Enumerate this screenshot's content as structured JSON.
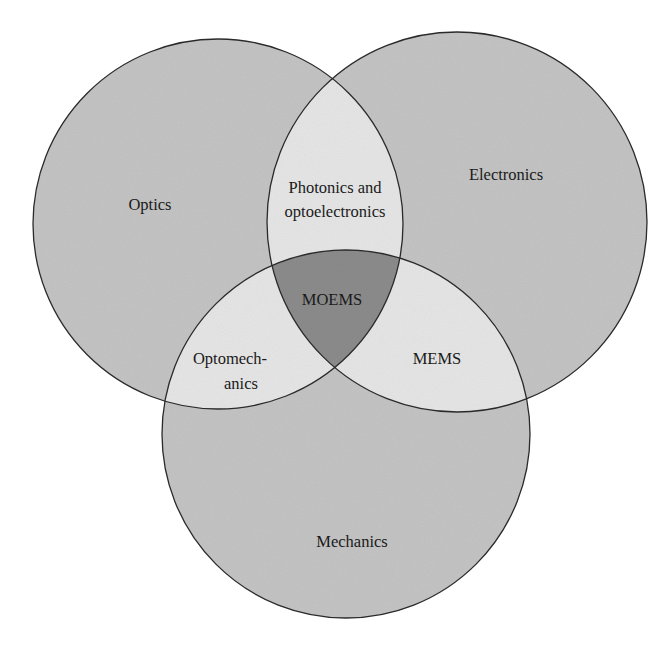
{
  "diagram": {
    "type": "venn",
    "sets": [
      {
        "id": "optics",
        "label": "Optics",
        "cx": 218,
        "cy": 224,
        "r": 185
      },
      {
        "id": "electronics",
        "label": "Electronics",
        "cx": 457,
        "cy": 222,
        "r": 190
      },
      {
        "id": "mechanics",
        "label": "Mechanics",
        "cx": 346,
        "cy": 434,
        "r": 184
      }
    ],
    "intersections": {
      "optics_electronics": {
        "label_line1": "Photonics and",
        "label_line2": "optoelectronics"
      },
      "optics_mechanics": {
        "label_line1": "Optomech-",
        "label_line2": "anics"
      },
      "electronics_mechanics": {
        "label": "MEMS"
      },
      "all": {
        "label": "MOEMS"
      }
    },
    "colors": {
      "single": "#c4c4c4",
      "pair": "#e6e6e6",
      "triple": "#8c8c8c",
      "stroke": "#2a2a2a",
      "background": "#ffffff"
    }
  }
}
